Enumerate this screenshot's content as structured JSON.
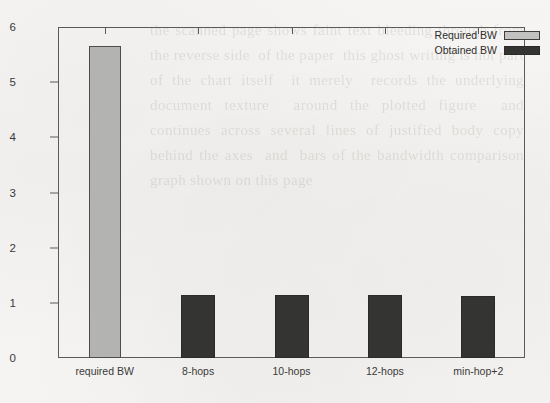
{
  "chart_data": {
    "type": "bar",
    "title": "",
    "xlabel": "",
    "ylabel": "",
    "ylim": [
      0,
      6
    ],
    "yticks": [
      0,
      1,
      2,
      3,
      4,
      5,
      6
    ],
    "grid": false,
    "legend_position": "top-right-inside",
    "categories": [
      "required BW",
      "8-hops",
      "10-hops",
      "12-hops",
      "min-hop+2"
    ],
    "series": [
      {
        "name": "Required BW",
        "color": "#b3b3b1",
        "values": [
          5.65,
          null,
          null,
          null,
          null
        ]
      },
      {
        "name": "Obtained BW",
        "color": "#343432",
        "values": [
          null,
          1.15,
          1.15,
          1.15,
          1.12
        ]
      }
    ],
    "bars": [
      {
        "category": "required BW",
        "series": "Required BW",
        "value": 5.65
      },
      {
        "category": "8-hops",
        "series": "Obtained BW",
        "value": 1.15
      },
      {
        "category": "10-hops",
        "series": "Obtained BW",
        "value": 1.15
      },
      {
        "category": "12-hops",
        "series": "Obtained BW",
        "value": 1.15
      },
      {
        "category": "min-hop+2",
        "series": "Obtained BW",
        "value": 1.12
      }
    ],
    "legend": [
      {
        "label": "Required BW",
        "swatch": "required"
      },
      {
        "label": "Obtained BW",
        "swatch": "obtained"
      }
    ]
  },
  "page": {
    "bleed_through_text": "the scanned page shows faint text bleeding through from the reverse side  of the paper  this ghost writing is not part of the chart itself  it merely  records the underlying document texture  around the plotted figure  and  continues across several lines of justified body copy  behind the axes  and  bars of the bandwidth comparison graph shown on this page"
  }
}
